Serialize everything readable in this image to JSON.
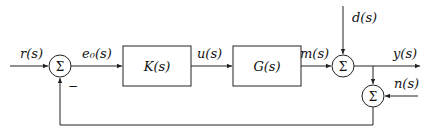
{
  "diagram": {
    "type": "feedback-control-block-diagram",
    "signals": {
      "reference": "r(s)",
      "error": "e₀(s)",
      "control": "u(s)",
      "plant_output": "m(s)",
      "disturbance": "d(s)",
      "output": "y(s)",
      "noise": "n(s)"
    },
    "blocks": {
      "controller": "K(s)",
      "plant": "G(s)"
    },
    "summing_junctions": {
      "sum1_symbol": "Σ",
      "sum1_feedback_sign": "−",
      "sum2_symbol": "Σ",
      "sum3_symbol": "Σ"
    }
  }
}
